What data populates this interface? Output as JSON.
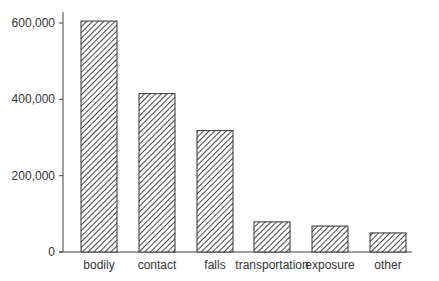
{
  "chart_data": {
    "type": "bar",
    "title": "",
    "xlabel": "",
    "ylabel": "",
    "categories": [
      "bodily",
      "contact",
      "falls",
      "transportation",
      "exposure",
      "other"
    ],
    "values": [
      605000,
      415000,
      318000,
      79000,
      68000,
      50000
    ],
    "ylim": [
      0,
      600000
    ],
    "yticks": [
      0,
      200000,
      400000,
      600000
    ],
    "ytick_labels": [
      "0",
      "200,000",
      "400,000",
      "600,000"
    ],
    "grid": false,
    "bar_fill": "diagonal-hatch",
    "colors": {
      "axis": "#444444",
      "bar_stroke": "#333333",
      "hatch": "#333333"
    }
  }
}
